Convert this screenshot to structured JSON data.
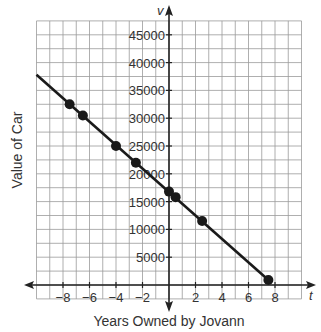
{
  "chart_data": {
    "type": "line",
    "title": "",
    "xlabel": "Years Owned by Jovann",
    "ylabel": "Value of Car",
    "x_axis_var": "t",
    "y_axis_var": "v",
    "xlim": [
      -10,
      10
    ],
    "ylim": [
      -2500,
      47500
    ],
    "x_ticks": [
      -8,
      -6,
      -4,
      -2,
      2,
      4,
      6,
      8
    ],
    "x_tick_labels": [
      "−8",
      "−6",
      "−4",
      "−2",
      "2",
      "4",
      "6",
      "8"
    ],
    "y_ticks": [
      5000,
      10000,
      15000,
      20000,
      25000,
      30000,
      35000,
      40000,
      45000
    ],
    "y_tick_labels": [
      "5000",
      "10000",
      "15000",
      "20000",
      "25000",
      "30000",
      "35000",
      "40000",
      "45000"
    ],
    "grid": true,
    "grid_x_step": 1,
    "grid_y_step": 2500,
    "legend": null,
    "series": [
      {
        "name": "Value of Car",
        "line": {
          "x": [
            -10,
            7.5
          ],
          "y": [
            37800,
            900
          ]
        },
        "points": {
          "x": [
            -7.5,
            -6.5,
            -4,
            -2.5,
            0,
            0.5,
            2.5,
            7.5
          ],
          "y": [
            32500,
            30500,
            25000,
            22000,
            16800,
            15800,
            11500,
            900
          ]
        }
      }
    ]
  },
  "colors": {
    "grid": "#9a9a9a",
    "axis": "#222222",
    "line": "#1a1a1a",
    "point": "#1a1a1a"
  }
}
